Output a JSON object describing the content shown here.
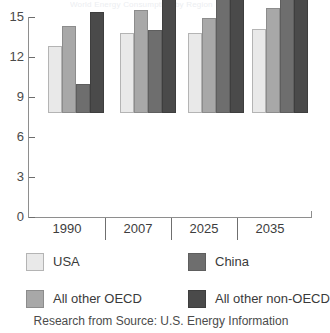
{
  "title_faint": "World Energy Consumption by Region",
  "source_note": "Research from Source: U.S. Energy Information",
  "axis": {
    "y_ticks": [
      "15",
      "12",
      "9",
      "6",
      "3",
      "0"
    ],
    "x_labels": [
      "1990",
      "2007",
      "2025",
      "2035"
    ]
  },
  "legend": {
    "usa": "USA",
    "china": "China",
    "oecd": "All other OECD",
    "nonoecd": "All other non-OECD"
  },
  "chart_data": {
    "type": "bar",
    "title": "World Energy Consumption by Region",
    "xlabel": "",
    "ylabel": "",
    "ylim": [
      0,
      15
    ],
    "yticks": [
      0,
      3,
      6,
      9,
      12,
      15
    ],
    "grid": false,
    "legend_position": "bottom",
    "categories": [
      "1990",
      "2007",
      "2025",
      "2035"
    ],
    "series": [
      {
        "name": "USA",
        "color": "#e9e9e9",
        "values": [
          5.0,
          6.0,
          6.0,
          6.3
        ]
      },
      {
        "name": "All other OECD",
        "color": "#a8a8a8",
        "values": [
          6.5,
          7.7,
          7.1,
          7.9
        ]
      },
      {
        "name": "China",
        "color": "#6e6e6e",
        "values": [
          2.2,
          6.2,
          10.6,
          13.4
        ]
      },
      {
        "name": "All other non-OECD",
        "color": "#4a4a4a",
        "values": [
          7.6,
          9.8,
          12.5,
          15.0
        ]
      }
    ],
    "source": "Research from Source: U.S. Energy Information"
  }
}
